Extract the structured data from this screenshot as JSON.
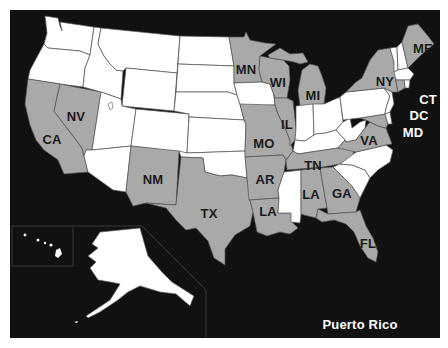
{
  "map": {
    "title": "United States map with highlighted states",
    "colors": {
      "ocean": "#111111",
      "highlighted_state": "#a9a9a9",
      "other_state": "#ffffff",
      "border": "#555555",
      "page_background": "#ffffff"
    },
    "highlighted_labels": [
      {
        "id": "ca",
        "text": "CA",
        "x": 52,
        "y": 139,
        "ocean": false
      },
      {
        "id": "nv",
        "text": "NV",
        "x": 76,
        "y": 116,
        "ocean": false
      },
      {
        "id": "nm",
        "text": "NM",
        "x": 153,
        "y": 179,
        "ocean": false
      },
      {
        "id": "tx",
        "text": "TX",
        "x": 209,
        "y": 213,
        "ocean": false
      },
      {
        "id": "mn",
        "text": "MN",
        "x": 246,
        "y": 69,
        "ocean": false
      },
      {
        "id": "wi",
        "text": "WI",
        "x": 278,
        "y": 82,
        "ocean": false
      },
      {
        "id": "mi",
        "text": "MI",
        "x": 313,
        "y": 95,
        "ocean": false
      },
      {
        "id": "il",
        "text": "IL",
        "x": 287,
        "y": 124,
        "ocean": false
      },
      {
        "id": "mo",
        "text": "MO",
        "x": 264,
        "y": 143,
        "ocean": false
      },
      {
        "id": "ar",
        "text": "AR",
        "x": 265,
        "y": 179,
        "ocean": false
      },
      {
        "id": "la",
        "text": "LA",
        "x": 268,
        "y": 211,
        "ocean": false
      },
      {
        "id": "tn",
        "text": "TN",
        "x": 313,
        "y": 165,
        "ocean": false
      },
      {
        "id": "al",
        "text": "LA",
        "x": 311,
        "y": 194,
        "ocean": false
      },
      {
        "id": "ga",
        "text": "GA",
        "x": 342,
        "y": 193,
        "ocean": false
      },
      {
        "id": "fl",
        "text": "FL",
        "x": 368,
        "y": 243,
        "ocean": false
      },
      {
        "id": "va",
        "text": "VA",
        "x": 369,
        "y": 140,
        "ocean": false
      },
      {
        "id": "ny",
        "text": "NY",
        "x": 385,
        "y": 81,
        "ocean": false
      },
      {
        "id": "me",
        "text": "ME",
        "x": 423,
        "y": 48,
        "ocean": false
      },
      {
        "id": "ct",
        "text": "CT",
        "x": 428,
        "y": 99,
        "ocean": true
      },
      {
        "id": "dc",
        "text": "DC",
        "x": 419,
        "y": 115,
        "ocean": true
      },
      {
        "id": "md",
        "text": "MD",
        "x": 413,
        "y": 132,
        "ocean": true
      }
    ],
    "territory_label": {
      "text": "Puerto Rico",
      "x": 360,
      "y": 324
    }
  }
}
